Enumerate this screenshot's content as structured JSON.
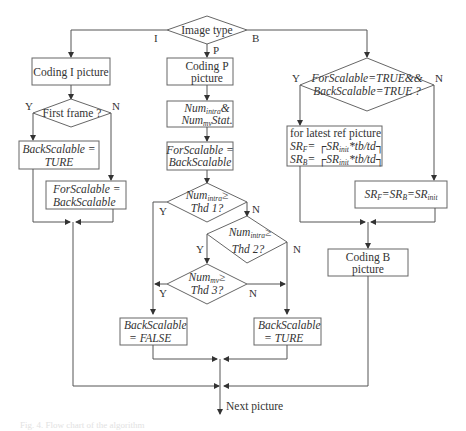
{
  "diagram": {
    "type": "flowchart",
    "start": {
      "label": "Image type"
    },
    "branches": {
      "i": "I",
      "p": "P",
      "b": "B"
    },
    "i_branch": {
      "coding": "Coding I picture",
      "decision": "First frame ?",
      "yes": "Y",
      "no": "N",
      "yes_box": [
        "BackScalable =",
        "TURE"
      ],
      "no_box": [
        "ForScalable =",
        "BackScalable"
      ]
    },
    "p_branch": {
      "coding": [
        "Coding P",
        "picture"
      ],
      "stat_box": {
        "line1_base": "Num",
        "line1_sub": "intra",
        "line1_tail": "&",
        "line2_base": "Num",
        "line2_sub": "mv",
        "line2_tail": "Stat."
      },
      "assign_box": [
        "ForScalable =",
        "BackScalable"
      ],
      "d1": {
        "base": "Num",
        "sub": "intra",
        "tail": "≥",
        "line2": "Thd 1?",
        "yes": "Y",
        "no": "N"
      },
      "d2": {
        "base": "Num",
        "sub": "intra",
        "tail": "≥",
        "line2": "Thd 2?",
        "yes": "Y",
        "no": "N"
      },
      "d3": {
        "base": "Num",
        "sub": "mv",
        "tail": "≥",
        "line2": "Thd 3?",
        "yes": "Y",
        "no": "N"
      },
      "false_box": [
        "BackScalable",
        "= FALSE"
      ],
      "true_box": [
        "BackScalable",
        "= TURE"
      ]
    },
    "b_branch": {
      "decision": [
        "ForScalable=TRUE&&",
        "BackScalable=TRUE ?"
      ],
      "yes": "Y",
      "no": "N",
      "yes_box": {
        "line1": "for latest ref picture",
        "line2": {
          "lhs": "SR",
          "lhs_sub": "F",
          "rhs": "= ┌SR",
          "rhs_sub": "init",
          "tail": "*tb/td┐"
        },
        "line3": {
          "lhs": "SR",
          "lhs_sub": "B",
          "rhs": "= ┌SR",
          "rhs_sub": "init",
          "tail": "*tb/td┐"
        }
      },
      "no_box": {
        "a": "SR",
        "a_sub": "F",
        "b": "=SR",
        "b_sub": "B",
        "c": "=SR",
        "c_sub": "init"
      },
      "coding": [
        "Coding B",
        "picture"
      ]
    },
    "end": {
      "label": "Next picture"
    },
    "caption": "Fig. 4. Flow chart of the algorithm"
  }
}
